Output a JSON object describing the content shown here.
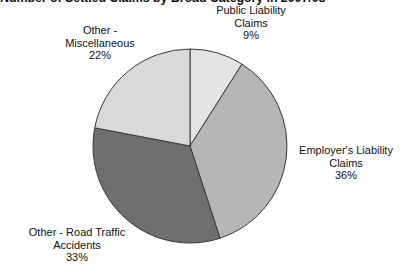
{
  "chart_data": {
    "type": "pie",
    "title": "Number of Settled Claims by Broad Category in 2007/08",
    "xlabel": "",
    "ylabel": "",
    "legend_position": "none",
    "grid": false,
    "start_angle_deg": 0,
    "direction": "clockwise",
    "categories": [
      "Public Liability Claims",
      "Employer's Liability Claims",
      "Other - Road Traffic Accidents",
      "Other - Miscellaneous"
    ],
    "values": [
      9,
      36,
      33,
      22
    ],
    "value_unit": "%",
    "colors": [
      "#e4e4e4",
      "#b6b6b6",
      "#6f6f6f",
      "#d9d9d9"
    ],
    "slice_border_color": "#3a3a3a",
    "slices": [
      {
        "name": "Public Liability Claims",
        "label_line1": "Public Liability",
        "label_line2": "Claims",
        "percent_label": "9%",
        "value": 9,
        "color": "#e4e4e4"
      },
      {
        "name": "Employer's Liability Claims",
        "label_line1": "Employer's Liability",
        "label_line2": "Claims",
        "percent_label": "36%",
        "value": 36,
        "color": "#b6b6b6"
      },
      {
        "name": "Other - Road Traffic Accidents",
        "label_line1": "Other - Road Traffic",
        "label_line2": "Accidents",
        "percent_label": "33%",
        "value": 33,
        "color": "#6f6f6f"
      },
      {
        "name": "Other - Miscellaneous",
        "label_line1": "Other -",
        "label_line2": "Miscellaneous",
        "percent_label": "22%",
        "value": 22,
        "color": "#d9d9d9"
      }
    ]
  }
}
